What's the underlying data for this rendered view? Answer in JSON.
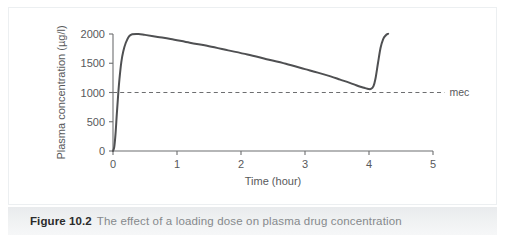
{
  "figure": {
    "caption_number": "Figure 10.2",
    "caption_title": "The effect of a loading dose on plasma drug concentration",
    "frame_color": "#eceff1",
    "caption_bar_color": "#eceef0"
  },
  "chart_data": {
    "type": "line",
    "title": "",
    "subtitle": "",
    "xlabel": "Time (hour)",
    "ylabel": "Plasma concentration (µg/l)",
    "xlim": [
      0,
      5
    ],
    "ylim": [
      0,
      2000
    ],
    "xticks": [
      0,
      1,
      2,
      3,
      4,
      5
    ],
    "xtick_labels": [
      "0",
      "1",
      "2",
      "3",
      "4",
      "5"
    ],
    "yticks": [
      0,
      500,
      1000,
      1500,
      2000
    ],
    "ytick_labels": [
      "0",
      "500",
      "1000",
      "1500",
      "2000"
    ],
    "grid": false,
    "legend_position": "none",
    "line_color": "#4f5052",
    "annotations": [
      {
        "name": "mec-threshold",
        "label": "mec",
        "type": "horizontal-line",
        "y": 1000,
        "style": "dashed",
        "x_start": 0,
        "x_end": 5.18,
        "color": "#6d6e70"
      }
    ],
    "series": [
      {
        "name": "plasma concentration with loading dose",
        "color": "#4f5052",
        "x": [
          0.0,
          0.02,
          0.04,
          0.06,
          0.08,
          0.1,
          0.13,
          0.16,
          0.2,
          0.25,
          0.3,
          0.4,
          0.5,
          0.7,
          0.9,
          1.2,
          1.5,
          1.8,
          2.1,
          2.4,
          2.7,
          3.0,
          3.2,
          3.4,
          3.55,
          3.7,
          3.8,
          3.88,
          3.94,
          3.99,
          4.03,
          4.07,
          4.1,
          4.14,
          4.18,
          4.22,
          4.26,
          4.3
        ],
        "y": [
          0,
          70,
          300,
          640,
          950,
          1220,
          1520,
          1700,
          1850,
          1960,
          1995,
          2000,
          1985,
          1950,
          1915,
          1850,
          1790,
          1720,
          1650,
          1570,
          1490,
          1400,
          1340,
          1275,
          1220,
          1165,
          1125,
          1095,
          1075,
          1060,
          1060,
          1110,
          1230,
          1500,
          1760,
          1910,
          1975,
          2005
        ]
      }
    ]
  }
}
